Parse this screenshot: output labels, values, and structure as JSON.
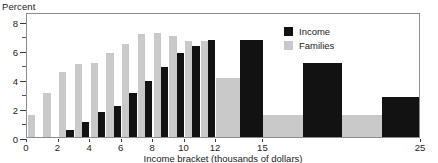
{
  "chart_data": {
    "type": "bar",
    "title": "",
    "ylabel": "Percent",
    "xlabel": "Income bracket (thousands of dollars)",
    "ylim": [
      0,
      8.6
    ],
    "xlim": [
      0,
      25
    ],
    "grid": false,
    "legend_position": "top-right",
    "y_ticks": [
      0,
      2,
      4,
      6,
      8
    ],
    "y_minor_ticks": [
      1,
      3,
      5,
      7
    ],
    "x_ticks": [
      0,
      2,
      4,
      6,
      8,
      10,
      12,
      15,
      25
    ],
    "series": [
      {
        "name": "Income",
        "color": "#121212",
        "values": [
          0,
          0,
          0.5,
          1.0,
          1.7,
          2.1,
          3.0,
          3.85,
          4.85,
          5.8,
          6.25,
          6.65,
          6.7,
          5.1,
          2.75
        ]
      },
      {
        "name": "Families",
        "color": "#c9c9c9",
        "values": [
          1.5,
          3.05,
          4.5,
          5.05,
          5.1,
          5.75,
          6.4,
          7.1,
          7.15,
          6.95,
          6.6,
          6.6,
          4.05,
          1.5,
          1.5
        ]
      }
    ],
    "brackets": [
      {
        "label": "0-1",
        "start": 0,
        "end": 1
      },
      {
        "label": "1-2",
        "start": 1,
        "end": 2
      },
      {
        "label": "2-3",
        "start": 2,
        "end": 3
      },
      {
        "label": "3-4",
        "start": 3,
        "end": 4
      },
      {
        "label": "4-5",
        "start": 4,
        "end": 5
      },
      {
        "label": "5-6",
        "start": 5,
        "end": 6
      },
      {
        "label": "6-7",
        "start": 6,
        "end": 7
      },
      {
        "label": "7-8",
        "start": 7,
        "end": 8
      },
      {
        "label": "8-9",
        "start": 8,
        "end": 9
      },
      {
        "label": "9-10",
        "start": 9,
        "end": 10
      },
      {
        "label": "10-11",
        "start": 10,
        "end": 11
      },
      {
        "label": "11-12",
        "start": 11,
        "end": 12
      },
      {
        "label": "12-15",
        "start": 12,
        "end": 15
      },
      {
        "label": "15-20",
        "start": 15,
        "end": 20
      },
      {
        "label": "20-25",
        "start": 20,
        "end": 25
      }
    ]
  },
  "legend": {
    "items": [
      {
        "label": "Income",
        "key": "income"
      },
      {
        "label": "Families",
        "key": "families"
      }
    ]
  }
}
